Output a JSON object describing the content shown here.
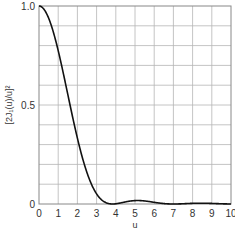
{
  "chart_data": {
    "type": "line",
    "title": "",
    "xlabel": "u",
    "ylabel": "[2J₁(u)/u]²",
    "xlim": [
      0,
      10
    ],
    "ylim": [
      0,
      1.0
    ],
    "grid": true,
    "legend": null,
    "x_ticks": [
      "0",
      "1",
      "2",
      "3",
      "4",
      "5",
      "6",
      "7",
      "8",
      "9",
      "10"
    ],
    "y_ticks": [
      "0",
      "0.5",
      "1.0"
    ],
    "grid_x_divisions": 10,
    "grid_y_divisions": 10,
    "series": [
      {
        "name": "[2J₁(u)/u]²",
        "color": "#111111",
        "x": [
          0,
          0.5,
          1.0,
          1.5,
          2.0,
          2.5,
          3.0,
          3.5,
          3.83,
          4.0,
          4.5,
          5.0,
          5.5,
          6.0,
          6.5,
          7.0,
          7.5,
          8.0,
          8.5,
          9.0,
          9.5,
          10.0
        ],
        "y": [
          1.0,
          0.939,
          0.775,
          0.553,
          0.333,
          0.158,
          0.051,
          0.006,
          0.0,
          0.001,
          0.011,
          0.017,
          0.015,
          0.009,
          0.002,
          0.0,
          0.001,
          0.003,
          0.004,
          0.003,
          0.001,
          0.0
        ]
      }
    ]
  },
  "colors": {
    "grid": "#b5b5b5",
    "frame": "#888888",
    "curve": "#111111",
    "text": "#333333"
  }
}
